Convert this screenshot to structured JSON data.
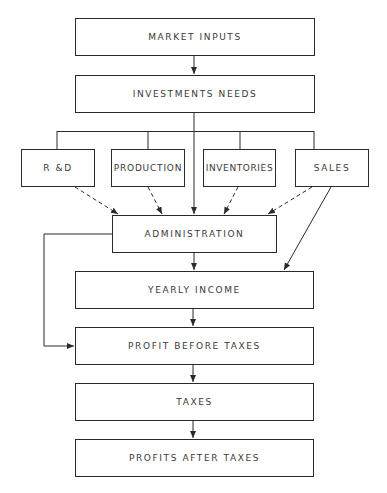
{
  "diagram": {
    "type": "flowchart",
    "nodes": {
      "market_inputs": "MARKET INPUTS",
      "investments_needs": "INVESTMENTS NEEDS",
      "rd": "R &D",
      "production": "PRODUCTION",
      "inventories": "INVENTORIES",
      "sales": "SALES",
      "administration": "ADMINISTRATION",
      "yearly_income": "YEARLY INCOME",
      "profit_before_taxes": "PROFIT BEFORE TAXES",
      "taxes": "TAXES",
      "profits_after_taxes": "PROFITS AFTER TAXES"
    },
    "edges": [
      {
        "from": "MARKET INPUTS",
        "to": "INVESTMENTS NEEDS",
        "style": "solid"
      },
      {
        "from": "INVESTMENTS NEEDS",
        "to": "R &D",
        "style": "solid-branch"
      },
      {
        "from": "INVESTMENTS NEEDS",
        "to": "PRODUCTION",
        "style": "solid-branch"
      },
      {
        "from": "INVESTMENTS NEEDS",
        "to": "INVENTORIES",
        "style": "solid-branch"
      },
      {
        "from": "INVESTMENTS NEEDS",
        "to": "SALES",
        "style": "solid-branch"
      },
      {
        "from": "INVESTMENTS NEEDS",
        "to": "ADMINISTRATION",
        "style": "solid"
      },
      {
        "from": "R &D",
        "to": "ADMINISTRATION",
        "style": "dashed"
      },
      {
        "from": "PRODUCTION",
        "to": "ADMINISTRATION",
        "style": "dashed"
      },
      {
        "from": "INVENTORIES",
        "to": "ADMINISTRATION",
        "style": "dashed"
      },
      {
        "from": "SALES",
        "to": "ADMINISTRATION",
        "style": "dashed"
      },
      {
        "from": "SALES",
        "to": "YEARLY INCOME",
        "style": "solid"
      },
      {
        "from": "ADMINISTRATION",
        "to": "YEARLY INCOME",
        "style": "solid"
      },
      {
        "from": "ADMINISTRATION",
        "to": "PROFIT BEFORE TAXES",
        "style": "solid"
      },
      {
        "from": "YEARLY INCOME",
        "to": "PROFIT BEFORE TAXES",
        "style": "solid"
      },
      {
        "from": "PROFIT BEFORE TAXES",
        "to": "TAXES",
        "style": "solid"
      },
      {
        "from": "TAXES",
        "to": "PROFITS AFTER TAXES",
        "style": "solid"
      }
    ]
  },
  "colors": {
    "line": "#2a2a2a",
    "text": "#3a3a3a",
    "background": "#ffffff"
  }
}
